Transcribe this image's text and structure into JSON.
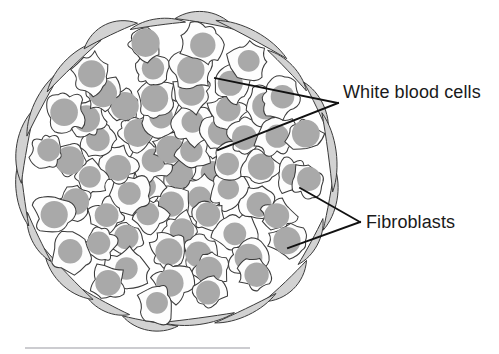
{
  "figure": {
    "background_color": "#ffffff",
    "labels": [
      {
        "id": "white-blood-cells",
        "text": "White blood cells",
        "x": 343,
        "y": 98,
        "color": "#1a1a1a",
        "font_size": 18,
        "leader_apex": [
          338,
          103
        ],
        "leader_targets": [
          [
            215,
            78
          ],
          [
            218,
            150
          ]
        ]
      },
      {
        "id": "fibroblasts",
        "text": "Fibroblasts",
        "x": 366,
        "y": 228,
        "color": "#1a1a1a",
        "font_size": 18,
        "leader_apex": [
          360,
          222
        ],
        "leader_targets": [
          [
            300,
            188
          ],
          [
            288,
            248
          ]
        ]
      }
    ],
    "cluster": {
      "center": [
        178,
        172
      ],
      "radius_x": 152,
      "radius_y": 148,
      "cell_count": 62,
      "cell_fill": "#fdfdfd",
      "cell_stroke": "#3c3c3c",
      "nucleus_color": "#a9a9a9",
      "nucleus_radius": 13,
      "fibroblast_count": 20,
      "fibroblast_fill": "#d2d2d2",
      "fibroblast_stroke": "#3a3a3a"
    },
    "rule": {
      "x1": 25,
      "y1": 348,
      "x2": 250,
      "y2": 348,
      "color": "#9a9aa2"
    }
  },
  "chart_data": {
    "type": "diagram",
    "annotations": [
      "White blood cells",
      "Fibroblasts"
    ],
    "elements": [
      {
        "name": "white blood cells",
        "count": 62,
        "shape": "irregular polygon with round nucleus",
        "fill": "#fdfdfd",
        "nucleus_fill": "#a9a9a9"
      },
      {
        "name": "fibroblasts",
        "count": 20,
        "shape": "elongated spindle/crescent",
        "fill": "#d2d2d2",
        "position": "outer ring"
      }
    ]
  }
}
